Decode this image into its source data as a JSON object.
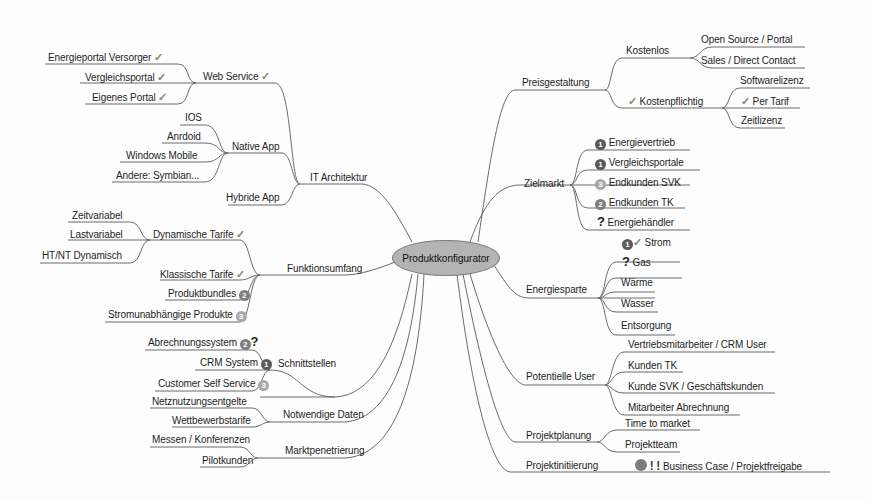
{
  "center": {
    "label": "Produktkonfigurator"
  },
  "left": {
    "it_architektur": {
      "label": "IT Architektur",
      "web_service": {
        "label": "Web Service",
        "check": "✓",
        "children": [
          {
            "label": "Energieportal Versorger",
            "check": "✓"
          },
          {
            "label": "Vergleichsportal",
            "check": "✓"
          },
          {
            "label": "Eigenes Portal",
            "check": "✓"
          }
        ]
      },
      "native_app": {
        "label": "Native App",
        "children": [
          {
            "label": "IOS"
          },
          {
            "label": "Anrdoid"
          },
          {
            "label": "Windows Mobile"
          },
          {
            "label": "Andere: Symbian..."
          }
        ]
      },
      "hybride_app": {
        "label": "Hybride App"
      }
    },
    "funktionsumfang": {
      "label": "Funktionsumfang",
      "dynamische_tarife": {
        "label": "Dynamische Tarife",
        "check": "✓",
        "children": [
          {
            "label": "Zeitvariabel"
          },
          {
            "label": "Lastvariabel"
          },
          {
            "label": "HT/NT Dynamisch"
          }
        ]
      },
      "klassische_tarife": {
        "label": "Klassische Tarife",
        "check": "✓"
      },
      "produktbundles": {
        "label": "Produktbundles",
        "priority": "2"
      },
      "stromunabhaengige": {
        "label": "Stromunabhängige Produkte",
        "priority": "3"
      }
    },
    "schnittstellen": {
      "label": "Schnittstellen",
      "children": [
        {
          "label": "Abrechnungssystem",
          "priority": "2",
          "question": "?"
        },
        {
          "label": "CRM System",
          "priority": "1"
        },
        {
          "label": "Customer Self Service",
          "priority": "3"
        }
      ]
    },
    "notwendige_daten": {
      "label": "Notwendige Daten",
      "children": [
        {
          "label": "Netznutzungsentgelte"
        },
        {
          "label": "Wettbewerbstarife"
        }
      ]
    },
    "marktpenetrierung": {
      "label": "Marktpenetrierung",
      "children": [
        {
          "label": "Messen / Konferenzen"
        },
        {
          "label": "Pilotkunden"
        }
      ]
    }
  },
  "right": {
    "preisgestaltung": {
      "label": "Preisgestaltung",
      "kostenlos": {
        "label": "Kostenlos",
        "children": [
          {
            "label": "Open Source / Portal"
          },
          {
            "label": "Sales / Direct Contact"
          }
        ]
      },
      "kostenpflichtig": {
        "label": "Kostenpflichtig",
        "check": "✓",
        "children": [
          {
            "label": "Softwarelizenz"
          },
          {
            "label": "Per Tarif",
            "check": "✓"
          },
          {
            "label": "Zeitlizenz"
          }
        ]
      }
    },
    "zielmarkt": {
      "label": "Zielmarkt",
      "children": [
        {
          "label": "Energievertrieb",
          "priority": "1"
        },
        {
          "label": "Vergleichsportale",
          "priority": "1"
        },
        {
          "label": "Endkunden SVK",
          "priority": "3"
        },
        {
          "label": "Endkunden TK",
          "priority": "2"
        },
        {
          "label": "Energiehändler",
          "question": "?"
        }
      ]
    },
    "energiesparte": {
      "label": "Energiesparte",
      "children": [
        {
          "label": "Strom",
          "priority": "1",
          "check": "✓"
        },
        {
          "label": "Gas",
          "question": "?"
        },
        {
          "label": "Wärme"
        },
        {
          "label": "Wasser"
        },
        {
          "label": "Entsorgung"
        }
      ]
    },
    "potentielle_user": {
      "label": "Potentielle User",
      "children": [
        {
          "label": "Vertriebsmitarbeiter / CRM User"
        },
        {
          "label": "Kunden TK"
        },
        {
          "label": "Kunde SVK / Geschäftskunden"
        },
        {
          "label": "Mitarbeiter Abrechnung"
        }
      ]
    },
    "projektplanung": {
      "label": "Projektplanung",
      "children": [
        {
          "label": "Time to market"
        },
        {
          "label": "Projektteam"
        }
      ]
    },
    "projektinitiierung": {
      "label": "Projektinitiierung",
      "children": [
        {
          "label": "Business Case / Projektfreigabe",
          "status": "stop",
          "exclaim": "!"
        }
      ]
    }
  }
}
